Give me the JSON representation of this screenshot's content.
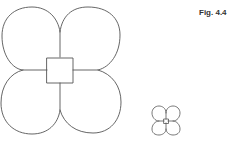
{
  "figure": {
    "label": "Fig. 4.4",
    "stroke_color": "#555555",
    "background": "#ffffff",
    "shapes": [
      {
        "name": "large-four-petal-flower",
        "description": "Four rounded petals around a central square",
        "center": [
          60,
          70
        ],
        "petal_count": 4,
        "center_shape": "square"
      },
      {
        "name": "small-four-petal-flower",
        "description": "Scaled-down copy of the four-petal flower with central square",
        "center": [
          166,
          121
        ],
        "petal_count": 4,
        "center_shape": "square"
      }
    ]
  }
}
